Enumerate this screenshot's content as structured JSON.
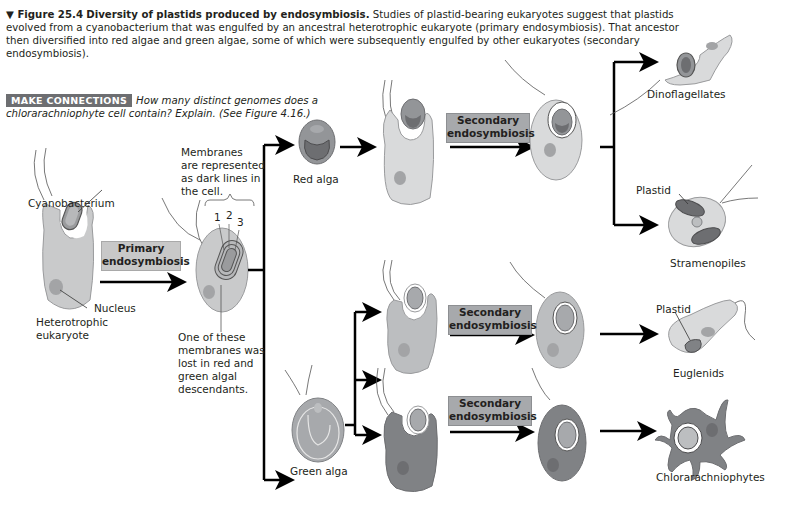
{
  "caption": {
    "figure_number": "▼ Figure 25.4",
    "title": "Diversity of plastids produced by endosymbiosis.",
    "text": "Studies of plastid-bearing eukaryotes suggest that plastids evolved from a cyanobacterium that was engulfed by an ancestral heterotrophic eukaryote (primary endosymbiosis). That ancestor then diversified into red algae and green algae, some of which were subsequently engulfed by other eukaryotes (secondary endosymbiosis)."
  },
  "make_connections": {
    "tag": "MAKE CONNECTIONS",
    "question": "How many distinct genomes does a chlorarachniophyte cell contain? Explain. (See Figure 4.16.)"
  },
  "labels": {
    "cyanobacterium": "Cyanobacterium",
    "nucleus": "Nucleus",
    "heterotrophic_1": "Heterotrophic",
    "heterotrophic_2": "eukaryote",
    "membranes_note": [
      "Membranes",
      "are represented",
      "as dark lines in",
      "the cell."
    ],
    "membrane_numbers": [
      "1",
      "2",
      "3"
    ],
    "lost_membrane_note": [
      "One of these",
      "membranes was",
      "lost in red and",
      "green algal",
      "descendants."
    ],
    "red_alga": "Red alga",
    "green_alga": "Green alga",
    "dinoflagellates": "Dinoflagellates",
    "stramenopiles": "Stramenopiles",
    "euglenids": "Euglenids",
    "chlorarachniophytes": "Chlorarachniophytes",
    "plastid_stramenopile": "Plastid",
    "plastid_euglenid": "Plastid"
  },
  "process_boxes": {
    "primary": [
      "Primary",
      "endosymbiosis"
    ],
    "secondary_red": [
      "Secondary",
      "endosymbiosis"
    ],
    "secondary_green_top": [
      "Secondary",
      "endosymbiosis"
    ],
    "secondary_green_bottom": [
      "Secondary",
      "endosymbiosis"
    ]
  },
  "colors": {
    "cell_light": "#d9dadb",
    "cell_mid": "#bcbec0",
    "red_alga": "#939598",
    "green_alga": "#a7a9ac",
    "dark_cell": "#808285",
    "arrow": "#000000",
    "box_fill": "#c8c8c8",
    "tag_fill": "#6d6e71"
  }
}
